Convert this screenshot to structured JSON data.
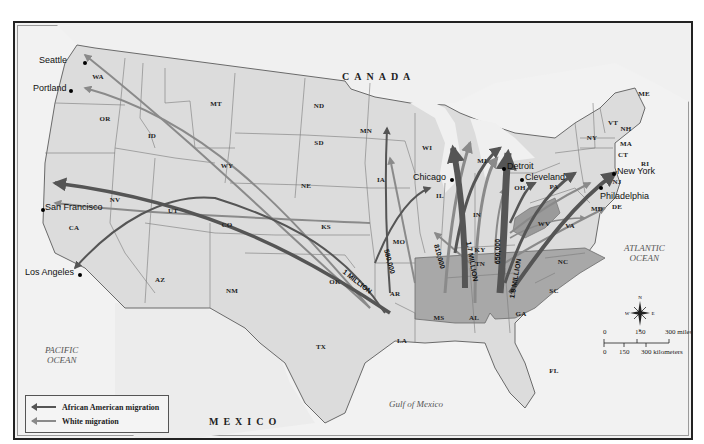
{
  "map": {
    "title": "Great Migration within the United States",
    "countries": {
      "north": "CANADA",
      "south": "MEXICO"
    },
    "water_bodies": {
      "pacific": [
        "PACIFIC",
        "OCEAN"
      ],
      "atlantic": [
        "ATLANTIC",
        "OCEAN"
      ],
      "gulf": "Gulf of Mexico"
    },
    "states": [
      "WA",
      "OR",
      "CA",
      "NV",
      "ID",
      "MT",
      "WY",
      "UT",
      "AZ",
      "CO",
      "NM",
      "ND",
      "SD",
      "NE",
      "KS",
      "OK",
      "TX",
      "MN",
      "IA",
      "MO",
      "AR",
      "LA",
      "WI",
      "IL",
      "MI",
      "IN",
      "KY",
      "TN",
      "MS",
      "AL",
      "GA",
      "FL",
      "SC",
      "NC",
      "VA",
      "WV",
      "OH",
      "PA",
      "NY",
      "MD",
      "DE",
      "NJ",
      "VT",
      "NH",
      "ME",
      "MA",
      "CT",
      "RI"
    ],
    "cities": {
      "seattle": "Seattle",
      "portland": "Portland",
      "san_francisco": "San Francisco",
      "los_angeles": "Los Angeles",
      "chicago": "Chicago",
      "detroit": "Detroit",
      "cleveland": "Cleveland",
      "new_york": "New York",
      "philadelphia": "Philadelphia"
    },
    "flow_labels": {
      "west": "1 MILLION",
      "midwest_west": "580,000",
      "illinois": "810,000",
      "central": "1.7 MILLION",
      "ohio": "650,000",
      "east": "1.8 MILLION"
    },
    "legend": {
      "african_american": "African American migration",
      "white": "White migration"
    },
    "scale": {
      "miles": [
        "0",
        "150",
        "300 miles"
      ],
      "kilometers": [
        "0",
        "150",
        "300 kilometers"
      ]
    },
    "compass": {
      "n": "N",
      "s": "S",
      "e": "E",
      "w": "W"
    },
    "colors": {
      "african_american_arrow": "#555555",
      "white_arrow": "#8a8a8a",
      "land": "#dcdcdc",
      "south_states": "#a8a8a8",
      "water": "#f2f2f2"
    }
  }
}
